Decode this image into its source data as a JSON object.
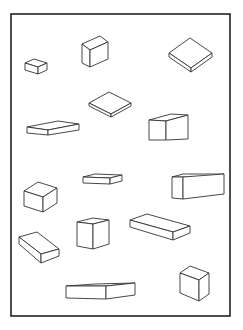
{
  "figure": {
    "width": 243,
    "height": 330,
    "background": "#ffffff",
    "stroke_color": "#333333",
    "frame": {
      "x": 11,
      "y": 14,
      "w": 219,
      "h": 302
    },
    "boxes": [
      {
        "name": "small-box-top-left",
        "faces": [
          "25,63 34,59 47,63 38,67",
          "25,63 38,67 38,74 25,70",
          "38,67 47,63 47,70 38,74"
        ]
      },
      {
        "name": "tall-box-top-center",
        "faces": [
          "82,44 100,36 108,42 90,50",
          "82,44 90,50 90,67 82,63",
          "90,50 108,42 108,59 90,67"
        ]
      },
      {
        "name": "flat-diamond-box-top-right",
        "faces": [
          "169,53 190,38 212,53 191,68",
          "169,53 191,68 191,72 169,57",
          "191,68 212,53 212,57 191,72"
        ]
      },
      {
        "name": "flat-diamond-box-upper-mid",
        "faces": [
          "89,103 109,92 131,103 111,114",
          "89,103 111,114 111,117 89,106",
          "111,114 131,103 131,106 111,117"
        ]
      },
      {
        "name": "long-slab-left",
        "faces": [
          "27,127 58,121 79,124 48,130",
          "27,127 48,130 48,135 27,133",
          "48,130 79,124 79,130 48,135"
        ]
      },
      {
        "name": "rect-box-right-upper",
        "faces": [
          "149,120 171,114 188,115 166,121",
          "149,120 166,121 166,140 149,140",
          "166,121 188,115 188,139 166,140"
        ]
      },
      {
        "name": "cube-left-middle",
        "faces": [
          "24,191 38,182 57,188 43,197",
          "24,191 43,197 43,212 24,206",
          "43,197 57,188 57,203 43,212"
        ]
      },
      {
        "name": "thin-slab-center",
        "faces": [
          "83,177 95,174 122,175 110,178",
          "83,177 110,178 110,184 83,183",
          "110,178 122,175 122,181 110,184"
        ]
      },
      {
        "name": "long-box-right-middle",
        "faces": [
          "172,177 183,174 224,174 213,177",
          "172,177 183,177 183,199 172,198",
          "183,177 224,174 224,194 183,199"
        ]
      },
      {
        "name": "tilted-slab-lower-left",
        "faces": [
          "19,237 37,232 59,249 41,254",
          "19,237 41,254 41,263 19,244",
          "41,254 59,249 59,256 41,263"
        ]
      },
      {
        "name": "cube-lower-center",
        "faces": [
          "77,222 93,218 109,220 93,224",
          "77,222 93,224 93,249 77,246",
          "93,224 109,220 109,244 93,249"
        ]
      },
      {
        "name": "tilted-slab-lower-right",
        "faces": [
          "130,220 147,214 190,226 173,232",
          "130,220 173,232 173,240 130,227",
          "173,232 190,226 190,233 173,240"
        ]
      },
      {
        "name": "long-slab-bottom",
        "faces": [
          "66,286 95,284 135,283 106,286",
          "66,286 106,286 106,299 66,298",
          "106,286 135,283 135,295 106,299"
        ]
      },
      {
        "name": "cube-bottom-right",
        "faces": [
          "180,273 190,266 209,273 199,280",
          "180,273 199,280 199,301 180,293",
          "199,280 209,273 209,294 199,301"
        ]
      }
    ]
  }
}
